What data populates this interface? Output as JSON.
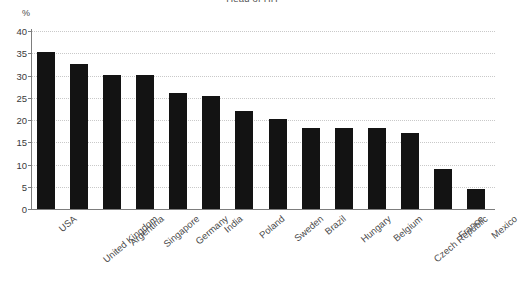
{
  "chart_data": {
    "type": "bar",
    "title": "Head of HH",
    "xlabel": "",
    "ylabel": "%",
    "ylim": [
      0,
      40
    ],
    "yticks": [
      0,
      5,
      10,
      15,
      20,
      25,
      30,
      35,
      40
    ],
    "grid": true,
    "legend": "none",
    "bar_color": "#131313",
    "categories": [
      "USA",
      "United Kingdom",
      "Argentina",
      "Singapore",
      "Germany",
      "India",
      "Poland",
      "Sweden",
      "Brazil",
      "Hungary",
      "Belgium",
      "Czech Republic",
      "France",
      "Mexico"
    ],
    "values": [
      35.2,
      32.7,
      30.2,
      30.2,
      26.0,
      25.3,
      22.0,
      20.2,
      18.3,
      18.3,
      18.3,
      17.0,
      9.0,
      4.5
    ]
  },
  "axis": {
    "unit_label": "%"
  }
}
